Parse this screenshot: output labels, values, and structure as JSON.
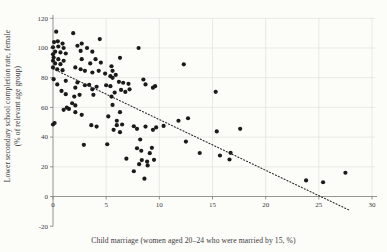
{
  "figure": {
    "background": "#fcfcf9"
  },
  "chart_data": {
    "type": "scatter",
    "title": "",
    "xlabel": "Child marriage (women aged 20–24 who were married by 15, %)",
    "ylabel_line1": "Lower secondary school completion rate, female",
    "ylabel_line2": "(% of relevant age group)",
    "xlim": [
      0,
      30
    ],
    "ylim": [
      -20,
      120
    ],
    "xticks": [
      0,
      5,
      10,
      15,
      20,
      25,
      30
    ],
    "yticks": [
      -20,
      0,
      20,
      40,
      60,
      80,
      100,
      120
    ],
    "grid": true,
    "legend": "none",
    "point_color": "#1b1b1b",
    "grid_color": "#dcdcd8",
    "axis_color": "#7a7a76",
    "text_color": "#3b3b3b",
    "trendline": {
      "style": "dotted",
      "x1": 0,
      "y1": 86,
      "x2": 27.8,
      "y2": -9
    },
    "points": [
      [
        0.3,
        111
      ],
      [
        1.9,
        110
      ],
      [
        0.1,
        104
      ],
      [
        0.45,
        104.5
      ],
      [
        0.9,
        103
      ],
      [
        2.7,
        103
      ],
      [
        0,
        100.5
      ],
      [
        0.5,
        101
      ],
      [
        1.0,
        100
      ],
      [
        2.3,
        101.5
      ],
      [
        3.2,
        100
      ],
      [
        0.2,
        97.5
      ],
      [
        0.7,
        97
      ],
      [
        1.2,
        96.3
      ],
      [
        2.6,
        98
      ],
      [
        3.7,
        97.5
      ],
      [
        4.4,
        106
      ],
      [
        0,
        95.8
      ],
      [
        0.06,
        93.6
      ],
      [
        0.5,
        92.5
      ],
      [
        2.7,
        92.5
      ],
      [
        4.0,
        92.5
      ],
      [
        0,
        91.4
      ],
      [
        1.0,
        91.4
      ],
      [
        3.5,
        89.6
      ],
      [
        4.5,
        90.2
      ],
      [
        0.2,
        89.6
      ],
      [
        0.7,
        89.1
      ],
      [
        0,
        86.9
      ],
      [
        2.1,
        86.9
      ],
      [
        0.4,
        85.7
      ],
      [
        2.6,
        85.7
      ],
      [
        0.9,
        85.1
      ],
      [
        3.0,
        84.6
      ],
      [
        4.3,
        84.6
      ],
      [
        5.6,
        84.6
      ],
      [
        3.7,
        83.5
      ],
      [
        4.9,
        82.8
      ],
      [
        5.9,
        81.9
      ],
      [
        8.05,
        100
      ],
      [
        6.3,
        93.4
      ],
      [
        12.3,
        89
      ],
      [
        5.5,
        87.7
      ],
      [
        0.06,
        79
      ],
      [
        1.2,
        77.9
      ],
      [
        2.3,
        76.8
      ],
      [
        3.4,
        75.2
      ],
      [
        4.1,
        73.9
      ],
      [
        5.4,
        81
      ],
      [
        5.6,
        79.9
      ],
      [
        6.2,
        77.2
      ],
      [
        6.6,
        76.6
      ],
      [
        7.1,
        75.9
      ],
      [
        8.5,
        78.8
      ],
      [
        0.4,
        75.5
      ],
      [
        0.8,
        71.1
      ],
      [
        2.1,
        73.3
      ],
      [
        3.0,
        74.9
      ],
      [
        3.7,
        72.2
      ],
      [
        5.0,
        74.9
      ],
      [
        5.4,
        74.3
      ],
      [
        5.8,
        70
      ],
      [
        6.4,
        71.8
      ],
      [
        6.8,
        70.4
      ],
      [
        7.2,
        72.2
      ],
      [
        8.7,
        75.5
      ],
      [
        9.4,
        73.3
      ],
      [
        9.6,
        74.3
      ],
      [
        15.3,
        70.5
      ],
      [
        1.2,
        68.9
      ],
      [
        2.0,
        67.3
      ],
      [
        2.5,
        68.5
      ],
      [
        3.8,
        68.5
      ],
      [
        5.5,
        67.3
      ],
      [
        1.8,
        62.8
      ],
      [
        2.1,
        61.3
      ],
      [
        5.6,
        61.7
      ],
      [
        1.0,
        58.4
      ],
      [
        1.3,
        59.9
      ],
      [
        1.5,
        59
      ],
      [
        2.1,
        56.8
      ],
      [
        2.7,
        55
      ],
      [
        6.3,
        56.8
      ],
      [
        5.2,
        53.9
      ],
      [
        6.0,
        51
      ],
      [
        11.8,
        51
      ],
      [
        12.7,
        52.7
      ],
      [
        0,
        48.5
      ],
      [
        0.15,
        49.5
      ],
      [
        3.6,
        48
      ],
      [
        4.1,
        47.1
      ],
      [
        6.0,
        48
      ],
      [
        6.5,
        48.5
      ],
      [
        7.6,
        47.3
      ],
      [
        9.7,
        46.5
      ],
      [
        10.4,
        47.5
      ],
      [
        5.7,
        44.9
      ],
      [
        6.3,
        43.3
      ],
      [
        7.9,
        45.6
      ],
      [
        8.7,
        47.1
      ],
      [
        9.4,
        44.9
      ],
      [
        15.4,
        43.8
      ],
      [
        17.6,
        45.6
      ],
      [
        2.9,
        34.8
      ],
      [
        5.1,
        35.2
      ],
      [
        8.2,
        38.4
      ],
      [
        12.5,
        37
      ],
      [
        7.9,
        32.5
      ],
      [
        8.3,
        30.8
      ],
      [
        9.3,
        32.8
      ],
      [
        9.1,
        29.2
      ],
      [
        13.8,
        29.3
      ],
      [
        15.7,
        27.6
      ],
      [
        16.7,
        29.4
      ],
      [
        16.6,
        24.9
      ],
      [
        6.9,
        25.5
      ],
      [
        8.35,
        24.5
      ],
      [
        8.85,
        23.5
      ],
      [
        9.5,
        24.7
      ],
      [
        8.1,
        21.8
      ],
      [
        8.9,
        20.9
      ],
      [
        7.6,
        17
      ],
      [
        8.6,
        12
      ],
      [
        23.8,
        10.8
      ],
      [
        25.4,
        9.6
      ],
      [
        27.5,
        16
      ]
    ]
  }
}
